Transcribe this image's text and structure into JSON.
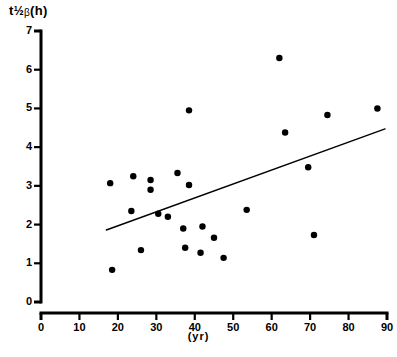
{
  "chart_data": {
    "type": "scatter",
    "title": "",
    "ylabel": "t½β(h)",
    "ylabel_parts": {
      "symbol": "t",
      "fraction": "½",
      "greek": "β",
      "unit": "(h)"
    },
    "xlabel": "(yr)",
    "xlim": [
      0,
      90
    ],
    "ylim": [
      0,
      7
    ],
    "xticks": [
      0,
      10,
      20,
      30,
      40,
      50,
      60,
      70,
      80,
      90
    ],
    "yticks": [
      0,
      1,
      2,
      3,
      4,
      5,
      6,
      7
    ],
    "grid": false,
    "legend": null,
    "marker": {
      "shape": "circle",
      "color": "#000000",
      "size": 5
    },
    "points": [
      {
        "x": 18,
        "y": 3.07
      },
      {
        "x": 18.5,
        "y": 0.83
      },
      {
        "x": 23.5,
        "y": 2.35
      },
      {
        "x": 24,
        "y": 3.25
      },
      {
        "x": 26,
        "y": 1.34
      },
      {
        "x": 28.5,
        "y": 3.15
      },
      {
        "x": 28.5,
        "y": 2.9
      },
      {
        "x": 30.5,
        "y": 2.28
      },
      {
        "x": 33,
        "y": 2.2
      },
      {
        "x": 35.5,
        "y": 3.33
      },
      {
        "x": 38.5,
        "y": 4.95
      },
      {
        "x": 38.5,
        "y": 3.02
      },
      {
        "x": 37,
        "y": 1.9
      },
      {
        "x": 37.5,
        "y": 1.4
      },
      {
        "x": 41.5,
        "y": 1.27
      },
      {
        "x": 42,
        "y": 1.95
      },
      {
        "x": 45,
        "y": 1.66
      },
      {
        "x": 47.5,
        "y": 1.14
      },
      {
        "x": 53.5,
        "y": 2.38
      },
      {
        "x": 62,
        "y": 6.3
      },
      {
        "x": 63.5,
        "y": 4.38
      },
      {
        "x": 69.5,
        "y": 3.48
      },
      {
        "x": 71,
        "y": 1.73
      },
      {
        "x": 74.5,
        "y": 4.83
      },
      {
        "x": 87.5,
        "y": 5.0
      }
    ],
    "trendline": {
      "type": "linear-fit",
      "x_start": 17.0,
      "y_start": 1.86,
      "x_end": 89.5,
      "y_end": 4.47,
      "color": "#000000",
      "width": 1.4
    },
    "axis_style": {
      "color": "#000000",
      "line_width": 3,
      "x_axis_detached": true
    }
  }
}
